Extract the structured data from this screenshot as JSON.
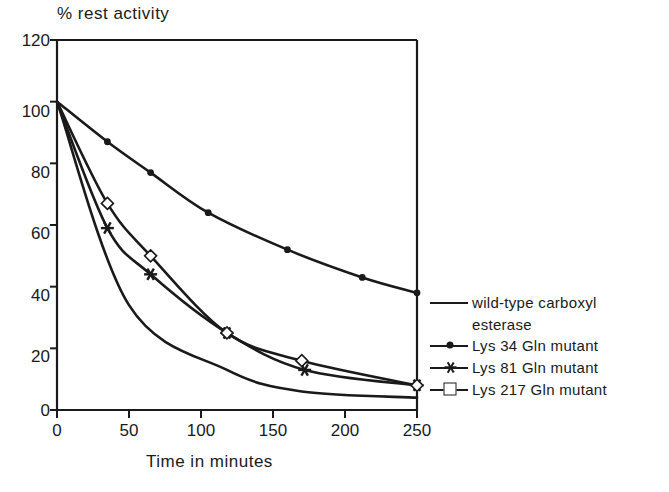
{
  "chart_data": {
    "type": "line",
    "title": "",
    "ylabel": "% rest activity",
    "xlabel": "Time in minutes",
    "xlim": [
      0,
      250
    ],
    "ylim": [
      0,
      120
    ],
    "xticks": [
      0,
      50,
      100,
      150,
      200,
      250
    ],
    "yticks": [
      0,
      20,
      40,
      60,
      80,
      100,
      120
    ],
    "grid": false,
    "legend_position": "right",
    "series": [
      {
        "name": "wild-type carboxyl esterase",
        "marker": "none",
        "x": [
          0,
          50,
          118,
          170,
          250
        ],
        "y": [
          100,
          34,
          13,
          6,
          4
        ]
      },
      {
        "name": "Lys 34 Gln mutant",
        "marker": "filled-circle",
        "x": [
          0,
          35,
          65,
          105,
          160,
          212,
          250
        ],
        "y": [
          100,
          87,
          77,
          64,
          52,
          43,
          38
        ]
      },
      {
        "name": "Lys 81 Gln mutant",
        "marker": "star",
        "x": [
          0,
          35,
          65,
          118,
          172,
          250
        ],
        "y": [
          100,
          59,
          44,
          25,
          13,
          8
        ]
      },
      {
        "name": "Lys 217 Gln mutant",
        "marker": "open-diamond",
        "x": [
          0,
          35,
          65,
          118,
          170,
          250
        ],
        "y": [
          100,
          67,
          50,
          25,
          16,
          8
        ]
      }
    ]
  },
  "axes": {
    "y_title": "% rest activity",
    "x_title": "Time in minutes",
    "y_tick_labels": [
      "120",
      "100",
      "80",
      "60",
      "40",
      "20",
      "0"
    ],
    "x_tick_labels": [
      "0",
      "50",
      "100",
      "150",
      "200",
      "250"
    ]
  },
  "legend": {
    "entries": [
      {
        "label": "wild-type carboxyl",
        "label_cont": "esterase",
        "marker": "none"
      },
      {
        "label": "Lys  34 Gln mutant",
        "marker": "filled-circle"
      },
      {
        "label": "Lys  81 Gln mutant",
        "marker": "star"
      },
      {
        "label": "Lys 217 Gln mutant",
        "marker": "open-diamond"
      }
    ]
  },
  "colors": {
    "ink": "#1a1a1a",
    "background": "#ffffff"
  }
}
